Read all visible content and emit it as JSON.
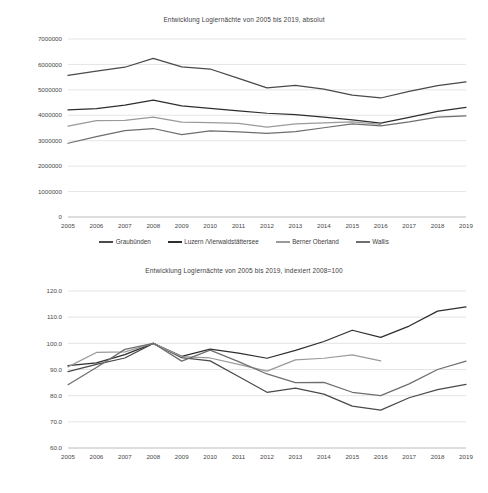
{
  "legend_labels": [
    "Graubünden",
    "Luzern /Vierwaldstättersee",
    "Berner Oberland",
    "Wallis"
  ],
  "series_colors": [
    "#4a4a4a",
    "#2e2e2e",
    "#9a9a9a",
    "#6e6e6e"
  ],
  "charts": [
    {
      "id": "chart-absolut",
      "title": "Entwicklung Logiernächte von 2005 bis 2019, absolut"
    },
    {
      "id": "chart-indexiert",
      "title": "Entwicklung Logiernächte von 2005 bis 2019, indexiert 2008=100"
    }
  ],
  "chart_data": [
    {
      "type": "line",
      "title": "Entwicklung Logiernächte von 2005 bis 2019, absolut",
      "xlabel": "",
      "ylabel": "",
      "x": [
        2005,
        2006,
        2007,
        2008,
        2009,
        2010,
        2011,
        2012,
        2013,
        2014,
        2015,
        2016,
        2017,
        2018,
        2019
      ],
      "xticklabels": [
        "2005",
        "2006",
        "2007",
        "2008",
        "2009",
        "2010",
        "2011",
        "2012",
        "2013",
        "2014",
        "2015",
        "2016",
        "2017",
        "2018",
        "2019"
      ],
      "yticklabels": [
        "0",
        "1000000",
        "2000000",
        "3000000",
        "4000000",
        "5000000",
        "6000000",
        "7000000"
      ],
      "yticks": [
        0,
        1000000,
        2000000,
        3000000,
        4000000,
        5000000,
        6000000,
        7000000
      ],
      "ylim": [
        0,
        7000000
      ],
      "grid": true,
      "legend_position": "bottom",
      "series": [
        {
          "name": "Graubünden",
          "color": "#4a4a4a",
          "values": [
            5570000,
            5740000,
            5890000,
            6240000,
            5900000,
            5820000,
            5450000,
            5080000,
            5180000,
            5030000,
            4790000,
            4680000,
            4940000,
            5170000,
            5310000
          ]
        },
        {
          "name": "Luzern /Vierwaldstättersee",
          "color": "#2e2e2e",
          "values": [
            4210000,
            4260000,
            4400000,
            4600000,
            4370000,
            4270000,
            4170000,
            4080000,
            4030000,
            3930000,
            3820000,
            3690000,
            3920000,
            4150000,
            4310000
          ]
        },
        {
          "name": "Berner Oberland",
          "color": "#9a9a9a",
          "values": [
            3570000,
            3790000,
            3800000,
            3930000,
            3730000,
            3710000,
            3680000,
            3530000,
            3660000,
            3700000,
            3740000,
            3640000,
            null,
            null,
            null
          ]
        },
        {
          "name": "Wallis",
          "color": "#6e6e6e",
          "values": [
            2900000,
            3160000,
            3400000,
            3480000,
            3240000,
            3390000,
            3350000,
            3290000,
            3360000,
            3510000,
            3660000,
            3580000,
            3740000,
            3930000,
            3980000
          ]
        }
      ]
    },
    {
      "type": "line",
      "title": "Entwicklung Logiernächte von 2005 bis 2019, indexiert 2008=100",
      "xlabel": "",
      "ylabel": "",
      "x": [
        2005,
        2006,
        2007,
        2008,
        2009,
        2010,
        2011,
        2012,
        2013,
        2014,
        2015,
        2016,
        2017,
        2018,
        2019
      ],
      "xticklabels": [
        "2005",
        "2006",
        "2007",
        "2008",
        "2009",
        "2010",
        "2011",
        "2012",
        "2013",
        "2014",
        "2015",
        "2016",
        "2017",
        "2018",
        "2019"
      ],
      "yticklabels": [
        "60.0",
        "70.0",
        "80.0",
        "90.0",
        "100.0",
        "110.0",
        "120.0"
      ],
      "yticks": [
        60,
        70,
        80,
        90,
        100,
        110,
        120
      ],
      "ylim": [
        60,
        120
      ],
      "grid": true,
      "legend_position": "bottom",
      "series": [
        {
          "name": "Graubünden",
          "color": "#4a4a4a",
          "values": [
            89.2,
            92.0,
            94.4,
            100.0,
            94.5,
            93.3,
            87.3,
            81.3,
            82.9,
            80.6,
            76.0,
            74.5,
            79.2,
            82.3,
            84.3
          ]
        },
        {
          "name": "Luzern /Vierwaldstättersee",
          "color": "#2e2e2e",
          "values": [
            91.5,
            92.5,
            95.7,
            100.0,
            95.0,
            97.8,
            96.3,
            94.3,
            97.3,
            100.7,
            105.0,
            102.3,
            106.6,
            112.3,
            113.9
          ]
        },
        {
          "name": "Berner Oberland",
          "color": "#9a9a9a",
          "values": [
            91.0,
            96.5,
            96.7,
            100.0,
            94.9,
            94.4,
            92.0,
            89.4,
            93.7,
            94.3,
            95.6,
            93.3,
            null,
            null,
            null
          ]
        },
        {
          "name": "Wallis",
          "color": "#6e6e6e",
          "values": [
            84.2,
            90.8,
            97.7,
            100.0,
            93.2,
            97.4,
            93.0,
            88.3,
            85.0,
            85.1,
            81.3,
            80.0,
            84.5,
            90.0,
            93.2
          ]
        }
      ]
    }
  ]
}
